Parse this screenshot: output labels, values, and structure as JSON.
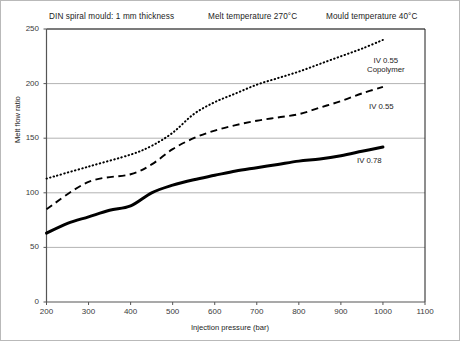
{
  "header": {
    "mould": "DIN spiral mould: 1 mm thickness",
    "melt_temperature": "Melt temperature 270°C",
    "mould_temperature": "Mould temperature 40°C"
  },
  "labels": {
    "copolymer_line1": "IV 0.55",
    "copolymer_line2": "Copolymer",
    "iv055": "IV 0.55",
    "iv078": "IV 0.78"
  },
  "colors": {
    "curve": "#000000",
    "grid": "#b3b3b3",
    "axis": "#4d4d4d",
    "text": "#1c1c1c"
  },
  "chart_data": {
    "type": "line",
    "title": "",
    "xlabel": "Injection pressure (bar)",
    "ylabel": "Melt flow ratio",
    "xlim": [
      200,
      1100
    ],
    "ylim": [
      0,
      250
    ],
    "xticks": [
      200,
      300,
      400,
      500,
      600,
      700,
      800,
      900,
      1000,
      1100
    ],
    "yticks": [
      0,
      50,
      100,
      150,
      200,
      250
    ],
    "grid": "horizontal",
    "legend_position": "inline-right",
    "series": [
      {
        "name": "IV 0.55 Copolymer",
        "style": "dotted",
        "x": [
          200,
          300,
          400,
          450,
          500,
          550,
          600,
          650,
          700,
          750,
          800,
          850,
          900,
          950,
          1000
        ],
        "values": [
          113,
          124,
          135,
          143,
          155,
          172,
          183,
          191,
          199,
          205,
          211,
          218,
          225,
          232,
          240
        ]
      },
      {
        "name": "IV 0.55",
        "style": "dashed",
        "x": [
          200,
          300,
          400,
          450,
          500,
          550,
          600,
          650,
          700,
          750,
          800,
          850,
          900,
          950,
          1000
        ],
        "values": [
          85,
          110,
          117,
          126,
          140,
          150,
          157,
          162,
          166,
          169,
          172,
          178,
          184,
          191,
          197
        ]
      },
      {
        "name": "IV 0.78",
        "style": "solid",
        "x": [
          200,
          250,
          300,
          350,
          400,
          450,
          500,
          550,
          600,
          650,
          700,
          750,
          800,
          850,
          900,
          950,
          1000
        ],
        "values": [
          63,
          72,
          78,
          84,
          88,
          100,
          107,
          112,
          116,
          120,
          123,
          126,
          129,
          131,
          134,
          138,
          142
        ]
      }
    ]
  }
}
